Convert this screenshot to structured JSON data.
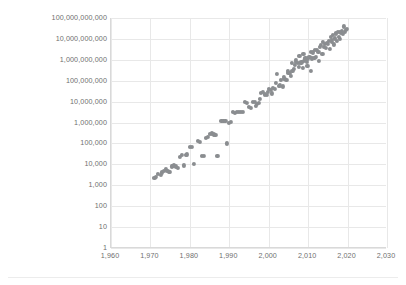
{
  "chart_data": {
    "type": "scatter",
    "title": "",
    "subtitle": "",
    "xlabel": "",
    "ylabel": "",
    "xlim": [
      1960,
      2030
    ],
    "ylim": [
      1,
      100000000000
    ],
    "yscale": "log",
    "xscale": "linear",
    "grid": true,
    "legend": false,
    "legend_position": "none",
    "marker_color": "#8a8d90",
    "gridline_color": "#e8e8e8",
    "axis_color": "#d9d9d9",
    "tick_label_color": "#6f6f6f",
    "background_color": "#ffffff",
    "x_ticks": [
      1960,
      1970,
      1980,
      1990,
      2000,
      2010,
      2020,
      2030
    ],
    "x_tick_labels": [
      "1,960",
      "1,970",
      "1,980",
      "1,990",
      "2,000",
      "2,010",
      "2,020",
      "2,030"
    ],
    "y_ticks": [
      1,
      10,
      100,
      1000,
      10000,
      100000,
      1000000,
      10000000,
      100000000,
      1000000000,
      10000000000,
      100000000000
    ],
    "y_tick_labels": [
      "1",
      "10",
      "100",
      "1,000",
      "10,000",
      "100,000",
      "1,000,000",
      "10,000,000",
      "100,000,000",
      "1,000,000,000",
      "10,000,000,000",
      "100,000,000,000"
    ],
    "series": [
      {
        "name": "transistor-count",
        "points": [
          [
            1971,
            2300
          ],
          [
            1971.4,
            2500
          ],
          [
            1972,
            3500
          ],
          [
            1972.6,
            3200
          ],
          [
            1973,
            4100
          ],
          [
            1974,
            6000
          ],
          [
            1974.3,
            5000
          ],
          [
            1974.6,
            4500
          ],
          [
            1975,
            4200
          ],
          [
            1975.4,
            8000
          ],
          [
            1975.8,
            8500
          ],
          [
            1976,
            9000
          ],
          [
            1976.4,
            8000
          ],
          [
            1977,
            6500
          ],
          [
            1978,
            29000
          ],
          [
            1978.5,
            9000
          ],
          [
            1979,
            29000
          ],
          [
            1979.3,
            30000
          ],
          [
            1980,
            68000
          ],
          [
            1981,
            11000
          ],
          [
            1982,
            134000
          ],
          [
            1982.5,
            120000
          ],
          [
            1983,
            25000
          ],
          [
            1983.5,
            26000
          ],
          [
            1984,
            190000
          ],
          [
            1984.5,
            200000
          ],
          [
            1985,
            275000
          ],
          [
            1986,
            273000
          ],
          [
            1986.5,
            250000
          ],
          [
            1987,
            25000
          ],
          [
            1988,
            1200000
          ],
          [
            1988.5,
            1180000
          ],
          [
            1989,
            1200000
          ],
          [
            1989.5,
            100000
          ],
          [
            1990,
            1000000
          ],
          [
            1991,
            3100000
          ],
          [
            1991.5,
            3000000
          ],
          [
            1992,
            3100000
          ],
          [
            1993,
            3100000
          ],
          [
            1993.5,
            3300000
          ],
          [
            1994,
            9300000
          ],
          [
            1994.5,
            9000000
          ],
          [
            1995,
            5500000
          ],
          [
            1995.5,
            5000000
          ],
          [
            1996,
            9500000
          ],
          [
            1996.5,
            9300000
          ],
          [
            1997,
            7500000
          ],
          [
            1997.5,
            8800000
          ],
          [
            1998,
            27000000
          ],
          [
            1998.5,
            28000000
          ],
          [
            1999,
            22000000
          ],
          [
            1999.5,
            21000000
          ],
          [
            2000,
            42000000
          ],
          [
            2000.5,
            37500000
          ],
          [
            2000.8,
            25000000
          ],
          [
            2001,
            45000000
          ],
          [
            2001.5,
            42000000
          ],
          [
            2002,
            220000000
          ],
          [
            2002.5,
            55000000
          ],
          [
            2003,
            105000000
          ],
          [
            2003.5,
            54000000
          ],
          [
            2004,
            125000000
          ],
          [
            2004.5,
            112000000
          ],
          [
            2005,
            230000000
          ],
          [
            2005.3,
            228000000
          ],
          [
            2005.6,
            169000000
          ],
          [
            2006,
            291000000
          ],
          [
            2006.3,
            380000000
          ],
          [
            2006.6,
            582000000
          ],
          [
            2007,
            789000000
          ],
          [
            2007.3,
            731000000
          ],
          [
            2007.6,
            463000000
          ],
          [
            2008,
            731000000
          ],
          [
            2008.3,
            758000000
          ],
          [
            2008.6,
            410000000
          ],
          [
            2009,
            904000000
          ],
          [
            2009.3,
            1170000000
          ],
          [
            2009.6,
            774000000
          ],
          [
            2010,
            1170000000
          ],
          [
            2010.3,
            1400000000
          ],
          [
            2010.6,
            2300000000
          ],
          [
            2011,
            1160000000
          ],
          [
            2011.3,
            2270000000
          ],
          [
            2011.6,
            1200000000
          ],
          [
            2012,
            1400000000
          ],
          [
            2012.3,
            3100000000
          ],
          [
            2012.6,
            2400000000
          ],
          [
            2013,
            4310000000
          ],
          [
            2013.3,
            5000000000
          ],
          [
            2013.6,
            1860000000
          ],
          [
            2014,
            4200000000
          ],
          [
            2014.3,
            5560000000
          ],
          [
            2014.6,
            3800000000
          ],
          [
            2015,
            5700000000
          ],
          [
            2015.3,
            8000000000
          ],
          [
            2015.6,
            3200000000
          ],
          [
            2016,
            7200000000
          ],
          [
            2016.3,
            15300000000
          ],
          [
            2016.6,
            5500000000
          ],
          [
            2017,
            19200000000
          ],
          [
            2017.3,
            8000000000
          ],
          [
            2017.6,
            21100000000
          ],
          [
            2018,
            10000000000
          ],
          [
            2018.3,
            19200000000
          ],
          [
            2018.6,
            23600000000
          ],
          [
            2019,
            39540000000
          ],
          [
            2019.3,
            21100000000
          ],
          [
            2019.6,
            26000000000
          ],
          [
            2006.8,
            1000000000
          ],
          [
            2009.8,
            500000000
          ],
          [
            2012.8,
            900000000
          ],
          [
            2010.8,
            300000000
          ],
          [
            2004.8,
            300000000
          ],
          [
            2002.8,
            60000000
          ],
          [
            2007.8,
            1500000000
          ],
          [
            2013.8,
            7000000000
          ],
          [
            2015.8,
            12000000000
          ],
          [
            2016.8,
            10500000000
          ],
          [
            2017.8,
            13000000000
          ],
          [
            2018.8,
            18000000000
          ],
          [
            2014.8,
            6500000000
          ],
          [
            2011.8,
            3000000000
          ],
          [
            2008.8,
            2000000000
          ],
          [
            2005.8,
            700000000
          ],
          [
            2003.8,
            150000000
          ],
          [
            2001.8,
            80000000
          ],
          [
            1999.8,
            30000000
          ],
          [
            1997.8,
            13000000
          ],
          [
            1985.5,
            300000
          ],
          [
            1980.5,
            70000
          ],
          [
            1977.5,
            22000
          ],
          [
            1973.5,
            4800
          ],
          [
            1990.5,
            1100000
          ],
          [
            1992.5,
            3200000
          ],
          [
            1996.8,
            6000000
          ],
          [
            2019.8,
            30000000000
          ],
          [
            2018.1,
            22000000000
          ],
          [
            2017.1,
            18000000000
          ],
          [
            2016.1,
            9000000000
          ]
        ]
      }
    ]
  }
}
